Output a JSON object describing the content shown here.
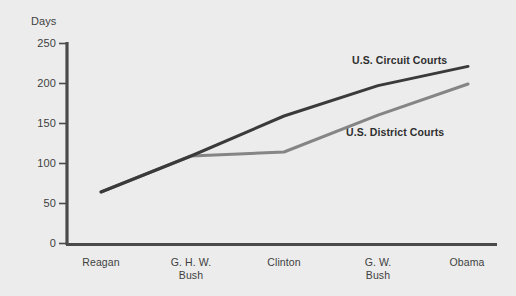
{
  "chart_data": {
    "type": "line",
    "title": "",
    "subtitle": "",
    "xlabel": "",
    "ylabel": "Days",
    "ylim": [
      0,
      250
    ],
    "yticks": [
      0,
      50,
      100,
      150,
      200,
      250
    ],
    "ytick_labels": [
      "0",
      "50",
      "100",
      "150",
      "200",
      "250"
    ],
    "categories": [
      "Reagan",
      "G. H. W. Bush",
      "Clinton",
      "G. W. Bush",
      "Obama"
    ],
    "category_lines": [
      [
        "Reagan"
      ],
      [
        "G. H. W.",
        "Bush"
      ],
      [
        "Clinton"
      ],
      [
        "G. W.",
        "Bush"
      ],
      [
        "Obama"
      ]
    ],
    "grid": false,
    "legend": "inline-annotations",
    "series": [
      {
        "name": "U.S. Circuit Courts",
        "color": "#3a3a3a",
        "values": [
          65,
          110,
          160,
          198,
          222
        ]
      },
      {
        "name": "U.S. District Courts",
        "color": "#858585",
        "values": [
          65,
          110,
          115,
          161,
          200
        ]
      }
    ],
    "annotations": [
      {
        "text": "U.S. Circuit Courts",
        "series": "U.S. Circuit Courts"
      },
      {
        "text": "U.S. District Courts",
        "series": "U.S. District Courts"
      }
    ]
  },
  "style": {
    "background": "#ebeceb",
    "axis_color": "#4a4a4a",
    "text_color": "#3f3f3f",
    "circuit_color": "#3a3a3a",
    "district_color": "#858585"
  }
}
